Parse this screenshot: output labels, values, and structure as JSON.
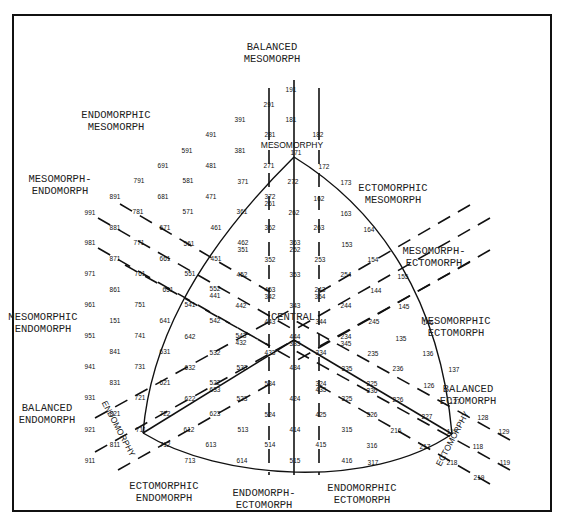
{
  "categories": [
    {
      "id": "balanced-mesomorph",
      "lines": [
        "BALANCED",
        "MESOMORPH"
      ],
      "x": 272,
      "y": 50
    },
    {
      "id": "endomorphic-mesomorph",
      "lines": [
        "ENDOMORPHIC",
        "MESOMORPH"
      ],
      "x": 116,
      "y": 118
    },
    {
      "id": "mesomorph-endomorph",
      "lines": [
        "MESOMORPH-",
        "ENDOMORPH"
      ],
      "x": 60,
      "y": 182
    },
    {
      "id": "ectomorphic-mesomorph",
      "lines": [
        "ECTOMORPHIC",
        "MESOMORPH"
      ],
      "x": 393,
      "y": 191
    },
    {
      "id": "mesomorph-ectomorph",
      "lines": [
        "MESOMORPH-",
        "ECTOMORPH"
      ],
      "x": 434,
      "y": 254
    },
    {
      "id": "mesomorphic-endomorph",
      "lines": [
        "MESOMORPHIC",
        "ENDOMORPH"
      ],
      "x": 43,
      "y": 320
    },
    {
      "id": "mesomorphic-ectomorph",
      "lines": [
        "MESOMORPHIC",
        "ECTOMORPH"
      ],
      "x": 456,
      "y": 324
    },
    {
      "id": "balanced-ectomorph",
      "lines": [
        "BALANCED",
        "ECTOMORPH"
      ],
      "x": 468,
      "y": 392
    },
    {
      "id": "balanced-endomorph",
      "lines": [
        "BALANCED",
        "ENDOMORPH"
      ],
      "x": 47,
      "y": 411
    },
    {
      "id": "ectomorphic-endomorph",
      "lines": [
        "ECTOMORPHIC",
        "ENDOMORPH"
      ],
      "x": 164,
      "y": 489
    },
    {
      "id": "endomorph-ectomorph",
      "lines": [
        "ENDOMORPH-",
        "ECTOMORPH"
      ],
      "x": 264,
      "y": 496
    },
    {
      "id": "endomorphic-ectomorph",
      "lines": [
        "ENDOMORPHIC",
        "ECTOMORPH"
      ],
      "x": 362,
      "y": 491
    }
  ],
  "axes": {
    "mesomorphy": {
      "label": "MESOMORPHY",
      "x": 292,
      "y": 148,
      "rotate": 0
    },
    "endomorphy": {
      "label": "ENDOMORPHY",
      "x": 116,
      "y": 430,
      "rotate": 62
    },
    "ectomorphy": {
      "label": "ECTOMORPHY",
      "x": 455,
      "y": 440,
      "rotate": -62
    },
    "central": {
      "label": "CENTRAL",
      "x": 293,
      "y": 320,
      "rotate": 0
    }
  },
  "somatotypes": [
    {
      "t": "191",
      "x": 291,
      "y": 92
    },
    {
      "t": "291",
      "x": 269,
      "y": 107
    },
    {
      "t": "181",
      "x": 291,
      "y": 122
    },
    {
      "t": "391",
      "x": 240,
      "y": 122
    },
    {
      "t": "491",
      "x": 211,
      "y": 137
    },
    {
      "t": "281",
      "x": 270,
      "y": 137
    },
    {
      "t": "182",
      "x": 318,
      "y": 137
    },
    {
      "t": "591",
      "x": 187,
      "y": 153
    },
    {
      "t": "381",
      "x": 240,
      "y": 153
    },
    {
      "t": "171",
      "x": 296,
      "y": 155
    },
    {
      "t": "691",
      "x": 163,
      "y": 168
    },
    {
      "t": "481",
      "x": 211,
      "y": 168
    },
    {
      "t": "271",
      "x": 269,
      "y": 168
    },
    {
      "t": "172",
      "x": 324,
      "y": 169
    },
    {
      "t": "173",
      "x": 346,
      "y": 185
    },
    {
      "t": "791",
      "x": 139,
      "y": 183
    },
    {
      "t": "581",
      "x": 188,
      "y": 183
    },
    {
      "t": "371",
      "x": 243,
      "y": 184
    },
    {
      "t": "272",
      "x": 293,
      "y": 184
    },
    {
      "t": "891",
      "x": 115,
      "y": 199
    },
    {
      "t": "681",
      "x": 163,
      "y": 199
    },
    {
      "t": "471",
      "x": 211,
      "y": 199
    },
    {
      "t": "372",
      "x": 270,
      "y": 199
    },
    {
      "t": "261",
      "x": 270,
      "y": 206
    },
    {
      "t": "162",
      "x": 319,
      "y": 201
    },
    {
      "t": "163",
      "x": 346,
      "y": 216
    },
    {
      "t": "991",
      "x": 90,
      "y": 215
    },
    {
      "t": "781",
      "x": 138,
      "y": 214
    },
    {
      "t": "571",
      "x": 188,
      "y": 214
    },
    {
      "t": "361",
      "x": 242,
      "y": 214
    },
    {
      "t": "262",
      "x": 294,
      "y": 215
    },
    {
      "t": "164",
      "x": 369,
      "y": 232
    },
    {
      "t": "881",
      "x": 115,
      "y": 230
    },
    {
      "t": "671",
      "x": 165,
      "y": 230
    },
    {
      "t": "461",
      "x": 216,
      "y": 230
    },
    {
      "t": "362",
      "x": 270,
      "y": 230
    },
    {
      "t": "263",
      "x": 319,
      "y": 230
    },
    {
      "t": "981",
      "x": 90,
      "y": 245
    },
    {
      "t": "771",
      "x": 139,
      "y": 245
    },
    {
      "t": "561",
      "x": 189,
      "y": 246
    },
    {
      "t": "462",
      "x": 243,
      "y": 245
    },
    {
      "t": "351",
      "x": 243,
      "y": 252
    },
    {
      "t": "363",
      "x": 295,
      "y": 245
    },
    {
      "t": "252",
      "x": 295,
      "y": 252
    },
    {
      "t": "153",
      "x": 347,
      "y": 247
    },
    {
      "t": "871",
      "x": 115,
      "y": 261
    },
    {
      "t": "661",
      "x": 165,
      "y": 261
    },
    {
      "t": "451",
      "x": 216,
      "y": 261
    },
    {
      "t": "352",
      "x": 270,
      "y": 262
    },
    {
      "t": "253",
      "x": 320,
      "y": 262
    },
    {
      "t": "154",
      "x": 373,
      "y": 262
    },
    {
      "t": "971",
      "x": 90,
      "y": 276
    },
    {
      "t": "761",
      "x": 140,
      "y": 276
    },
    {
      "t": "551",
      "x": 190,
      "y": 276
    },
    {
      "t": "452",
      "x": 242,
      "y": 277
    },
    {
      "t": "353",
      "x": 295,
      "y": 277
    },
    {
      "t": "254",
      "x": 346,
      "y": 277
    },
    {
      "t": "155",
      "x": 403,
      "y": 279
    },
    {
      "t": "861",
      "x": 115,
      "y": 292
    },
    {
      "t": "651",
      "x": 168,
      "y": 292
    },
    {
      "t": "552",
      "x": 215,
      "y": 291
    },
    {
      "t": "441",
      "x": 215,
      "y": 298
    },
    {
      "t": "453",
      "x": 270,
      "y": 292
    },
    {
      "t": "342",
      "x": 270,
      "y": 299
    },
    {
      "t": "243",
      "x": 320,
      "y": 292
    },
    {
      "t": "354",
      "x": 320,
      "y": 299
    },
    {
      "t": "144",
      "x": 376,
      "y": 293
    },
    {
      "t": "961",
      "x": 90,
      "y": 307
    },
    {
      "t": "751",
      "x": 140,
      "y": 307
    },
    {
      "t": "541",
      "x": 190,
      "y": 307
    },
    {
      "t": "442",
      "x": 241,
      "y": 308
    },
    {
      "t": "343",
      "x": 295,
      "y": 308
    },
    {
      "t": "244",
      "x": 346,
      "y": 308
    },
    {
      "t": "145",
      "x": 404,
      "y": 309
    },
    {
      "t": "151",
      "x": 115,
      "y": 323
    },
    {
      "t": "641",
      "x": 165,
      "y": 323
    },
    {
      "t": "542",
      "x": 215,
      "y": 323
    },
    {
      "t": "443",
      "x": 270,
      "y": 324
    },
    {
      "t": "344",
      "x": 321,
      "y": 324
    },
    {
      "t": "245",
      "x": 374,
      "y": 324
    },
    {
      "t": "146",
      "x": 428,
      "y": 325
    },
    {
      "t": "951",
      "x": 90,
      "y": 338
    },
    {
      "t": "741",
      "x": 140,
      "y": 338
    },
    {
      "t": "642",
      "x": 190,
      "y": 339
    },
    {
      "t": "543",
      "x": 241,
      "y": 338
    },
    {
      "t": "432",
      "x": 241,
      "y": 345
    },
    {
      "t": "444",
      "x": 295,
      "y": 339
    },
    {
      "t": "333",
      "x": 295,
      "y": 346
    },
    {
      "t": "234",
      "x": 346,
      "y": 339
    },
    {
      "t": "345",
      "x": 346,
      "y": 346
    },
    {
      "t": "135",
      "x": 401,
      "y": 341
    },
    {
      "t": "841",
      "x": 115,
      "y": 354
    },
    {
      "t": "631",
      "x": 165,
      "y": 354
    },
    {
      "t": "532",
      "x": 215,
      "y": 355
    },
    {
      "t": "433",
      "x": 270,
      "y": 355
    },
    {
      "t": "334",
      "x": 321,
      "y": 355
    },
    {
      "t": "235",
      "x": 373,
      "y": 356
    },
    {
      "t": "136",
      "x": 428,
      "y": 356
    },
    {
      "t": "941",
      "x": 90,
      "y": 369
    },
    {
      "t": "731",
      "x": 140,
      "y": 369
    },
    {
      "t": "632",
      "x": 190,
      "y": 370
    },
    {
      "t": "533",
      "x": 242,
      "y": 370
    },
    {
      "t": "434",
      "x": 295,
      "y": 370
    },
    {
      "t": "335",
      "x": 347,
      "y": 371
    },
    {
      "t": "236",
      "x": 398,
      "y": 371
    },
    {
      "t": "137",
      "x": 454,
      "y": 372
    },
    {
      "t": "831",
      "x": 115,
      "y": 385
    },
    {
      "t": "621",
      "x": 165,
      "y": 385
    },
    {
      "t": "522",
      "x": 215,
      "y": 385
    },
    {
      "t": "633",
      "x": 215,
      "y": 392
    },
    {
      "t": "534",
      "x": 270,
      "y": 386
    },
    {
      "t": "324",
      "x": 321,
      "y": 386
    },
    {
      "t": "435",
      "x": 321,
      "y": 392
    },
    {
      "t": "225",
      "x": 372,
      "y": 386
    },
    {
      "t": "336",
      "x": 372,
      "y": 393
    },
    {
      "t": "126",
      "x": 429,
      "y": 388
    },
    {
      "t": "931",
      "x": 90,
      "y": 400
    },
    {
      "t": "721",
      "x": 140,
      "y": 400
    },
    {
      "t": "622",
      "x": 190,
      "y": 401
    },
    {
      "t": "523",
      "x": 242,
      "y": 401
    },
    {
      "t": "424",
      "x": 295,
      "y": 401
    },
    {
      "t": "325",
      "x": 347,
      "y": 401
    },
    {
      "t": "226",
      "x": 398,
      "y": 402
    },
    {
      "t": "127",
      "x": 455,
      "y": 404
    },
    {
      "t": "821",
      "x": 115,
      "y": 416
    },
    {
      "t": "722",
      "x": 165,
      "y": 416
    },
    {
      "t": "623",
      "x": 215,
      "y": 416
    },
    {
      "t": "524",
      "x": 270,
      "y": 417
    },
    {
      "t": "425",
      "x": 321,
      "y": 417
    },
    {
      "t": "326",
      "x": 372,
      "y": 417
    },
    {
      "t": "227",
      "x": 427,
      "y": 419
    },
    {
      "t": "128",
      "x": 483,
      "y": 420
    },
    {
      "t": "921",
      "x": 90,
      "y": 432
    },
    {
      "t": "711",
      "x": 141,
      "y": 432
    },
    {
      "t": "612",
      "x": 189,
      "y": 432
    },
    {
      "t": "513",
      "x": 243,
      "y": 432
    },
    {
      "t": "414",
      "x": 295,
      "y": 432
    },
    {
      "t": "315",
      "x": 347,
      "y": 432
    },
    {
      "t": "216",
      "x": 396,
      "y": 433
    },
    {
      "t": "117",
      "x": 452,
      "y": 434
    },
    {
      "t": "129",
      "x": 504,
      "y": 434
    },
    {
      "t": "811",
      "x": 115,
      "y": 447
    },
    {
      "t": "712",
      "x": 165,
      "y": 447
    },
    {
      "t": "613",
      "x": 211,
      "y": 447
    },
    {
      "t": "514",
      "x": 270,
      "y": 447
    },
    {
      "t": "415",
      "x": 321,
      "y": 447
    },
    {
      "t": "316",
      "x": 372,
      "y": 448
    },
    {
      "t": "217",
      "x": 425,
      "y": 449
    },
    {
      "t": "118",
      "x": 478,
      "y": 449
    },
    {
      "t": "911",
      "x": 90,
      "y": 463
    },
    {
      "t": "713",
      "x": 190,
      "y": 463
    },
    {
      "t": "614",
      "x": 242,
      "y": 463
    },
    {
      "t": "515",
      "x": 295,
      "y": 463
    },
    {
      "t": "416",
      "x": 347,
      "y": 463
    },
    {
      "t": "317",
      "x": 373,
      "y": 465
    },
    {
      "t": "218",
      "x": 452,
      "y": 465
    },
    {
      "t": "119",
      "x": 505,
      "y": 465
    },
    {
      "t": "219",
      "x": 479,
      "y": 480
    }
  ],
  "colors": {
    "ink": "#111111",
    "background": "#ffffff"
  }
}
